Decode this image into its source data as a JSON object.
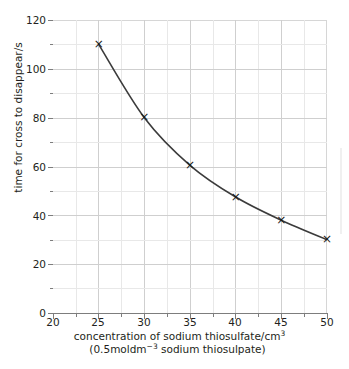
{
  "chart_data": {
    "type": "line",
    "title": "",
    "xlabel_line1": "concentration of sodium thiosulfate/cm3",
    "xlabel_line2": "(0.5 mol dm-3 sodium thiosulpate)",
    "ylabel": "time for cross to disappear/s",
    "x": [
      25,
      30,
      35,
      40,
      45,
      50
    ],
    "values": [
      110,
      80,
      60.5,
      47.5,
      38,
      30
    ],
    "series": [
      {
        "name": "time for cross to disappear",
        "x": [
          25,
          30,
          35,
          40,
          45,
          50
        ],
        "values": [
          110,
          80,
          60.5,
          47.5,
          38,
          30
        ]
      }
    ],
    "xlim": [
      20,
      50
    ],
    "ylim": [
      0,
      120
    ],
    "x_ticks": [
      20,
      25,
      30,
      35,
      40,
      45,
      50
    ],
    "y_ticks": [
      0,
      20,
      40,
      60,
      80,
      100,
      120
    ],
    "x_minor_step": 2.5,
    "y_minor_step": 10,
    "x_tick_labels": [
      "20",
      "25",
      "30",
      "35",
      "40",
      "45",
      "50"
    ],
    "y_tick_labels": [
      "0",
      "20",
      "40",
      "60",
      "80",
      "100",
      "120"
    ],
    "grid": true,
    "legend": "none",
    "marker": "x",
    "line_color": "#3b3b3b",
    "marker_color": "#1a1a1a",
    "grid_color": "#cfcfcf",
    "axis_color": "#7d7d7d",
    "text_color": "#231f20",
    "background": "#ffffff"
  },
  "axes": {
    "x_title": {
      "line1_pre": "concentration of sodium thiosulfate/cm",
      "line1_sup": "3",
      "line2_pre": "(0.5",
      "line2_mol": "mol",
      "line2_dm": "dm",
      "line2_sup": "−3",
      "line2_post": "sodium thiosulpate)"
    },
    "y_title": "time for cross to disappear/s"
  }
}
